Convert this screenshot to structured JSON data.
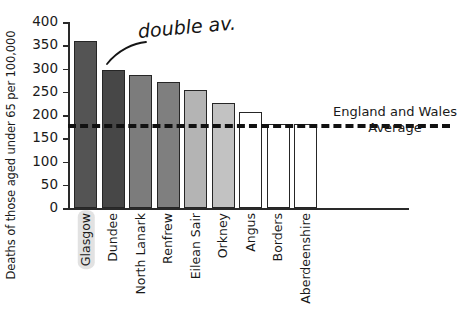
{
  "chart_data": {
    "type": "bar",
    "title": "",
    "xlabel": "",
    "ylabel": "Deaths of those aged under 65 per 100,000",
    "ylim": [
      0,
      400
    ],
    "yticks": [
      0,
      50,
      100,
      150,
      200,
      250,
      300,
      350,
      400
    ],
    "grid": false,
    "categories": [
      "Glasgow",
      "Dundee",
      "North Lanark",
      "Renfrew",
      "Eilean Sair",
      "Orkney",
      "Angus",
      "Borders",
      "Aberdeenshire"
    ],
    "values": [
      360,
      296,
      286,
      271,
      253,
      226,
      207,
      180,
      180
    ],
    "bar_colors": [
      "#545454",
      "#474747",
      "#7c7c7c",
      "#7f7f7f",
      "#b4b4b4",
      "#c2c2c2",
      "#ffffff",
      "#ffffff",
      "#ffffff"
    ],
    "highlighted_category": "Glasgow",
    "reference_line": {
      "label_line_1": "England and Wales",
      "label_line_2": "Average",
      "value": 180,
      "style": "dashed",
      "color": "#111111"
    },
    "annotations": [
      {
        "text": "double av.",
        "target_category": "Glasgow",
        "style": "handwritten"
      }
    ]
  },
  "legend": {
    "position": "right",
    "line_1": "England and Wales",
    "line_2": "Average"
  },
  "annotation": {
    "text": "double av."
  },
  "axis": {
    "y_title": "Deaths of those aged under 65 per 100,000"
  }
}
